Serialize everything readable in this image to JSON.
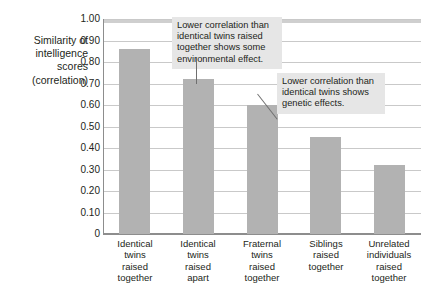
{
  "chart_data": {
    "type": "bar",
    "title": "",
    "subtitle": "",
    "xlabel": "",
    "ylabel": "Similarity of intelligence scores (correlation)",
    "ylabel_lines": [
      "Similarity of",
      "intelligence",
      "scores",
      "(correlation)"
    ],
    "categories": [
      "Identical twins raised together",
      "Identical twins raised apart",
      "Fraternal twins raised together",
      "Siblings raised together",
      "Unrelated individuals raised together"
    ],
    "category_lines": [
      [
        "Identical",
        "twins",
        "raised",
        "together"
      ],
      [
        "Identical",
        "twins",
        "raised",
        "apart"
      ],
      [
        "Fraternal",
        "twins",
        "raised",
        "together"
      ],
      [
        "Siblings",
        "raised",
        "together"
      ],
      [
        "Unrelated",
        "individuals",
        "raised",
        "together"
      ]
    ],
    "values": [
      0.86,
      0.72,
      0.6,
      0.45,
      0.32
    ],
    "ylim": [
      0,
      1.0
    ],
    "ytick_values": [
      1.0,
      0.9,
      0.8,
      0.7,
      0.6,
      0.5,
      0.4,
      0.3,
      0.2,
      0.1,
      0
    ],
    "ytick_labels": [
      "1.00",
      "0.90",
      "0.80",
      "0.70",
      "0.60",
      "0.50",
      "0.40",
      "0.30",
      "0.20",
      "0.10",
      "0"
    ],
    "grid": true,
    "legend": "none",
    "bar_color": "#b2b2b2",
    "grid_color": "#c9c9c9",
    "axis_color": "#8d8d8d",
    "annotations": [
      {
        "id": "annotation-environmental-effect",
        "text": "Lower correlation than identical twins raised together shows some environmental effect.",
        "lines": [
          "Lower correlation than",
          "identical twins raised",
          "together shows some",
          "environmental effect."
        ],
        "points_to": "Identical twins raised apart"
      },
      {
        "id": "annotation-genetic-effects",
        "text": "Lower correlation than identical twins shows genetic effects.",
        "lines": [
          "Lower correlation than",
          "identical twins shows",
          "genetic effects."
        ],
        "points_to": "Fraternal twins raised together"
      }
    ]
  }
}
